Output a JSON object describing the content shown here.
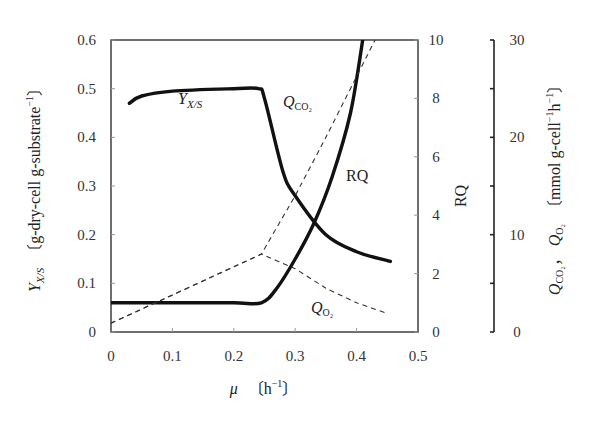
{
  "chart_data": {
    "type": "line",
    "title": "",
    "xlabel": "μ〔h⁻¹〕",
    "x_ticks": [
      "0",
      "0.1",
      "0.2",
      "0.3",
      "0.4",
      "0.5"
    ],
    "xlim": [
      0,
      0.5
    ],
    "axes": {
      "left": {
        "label": "Y_X/S〔g-dry-cell g-substrate⁻¹〕",
        "ticks": [
          "0",
          "0.1",
          "0.2",
          "0.3",
          "0.4",
          "0.5",
          "0.6"
        ],
        "lim": [
          0,
          0.6
        ]
      },
      "right_inner": {
        "label": "RQ",
        "ticks": [
          "0",
          "2",
          "4",
          "6",
          "8",
          "10"
        ],
        "lim": [
          0,
          10
        ]
      },
      "right_outer": {
        "label": "Q_CO2, Q_O2〔mmol g-cell⁻¹h⁻¹〕",
        "ticks": [
          "0",
          "10",
          "20",
          "30"
        ],
        "lim": [
          0,
          30
        ]
      }
    },
    "grid": false,
    "legend": "inline labels",
    "series": [
      {
        "name": "Y_X/S",
        "axis": "left",
        "style": "solid-thick",
        "x": [
          0.03,
          0.05,
          0.1,
          0.2,
          0.24,
          0.25,
          0.28,
          0.3,
          0.35,
          0.4,
          0.455
        ],
        "y": [
          0.47,
          0.485,
          0.495,
          0.5,
          0.5,
          0.48,
          0.33,
          0.28,
          0.2,
          0.165,
          0.145
        ]
      },
      {
        "name": "RQ",
        "axis": "right_inner",
        "style": "solid-thick",
        "x": [
          0,
          0.1,
          0.2,
          0.245,
          0.27,
          0.3,
          0.33,
          0.36,
          0.39,
          0.41
        ],
        "y": [
          1.0,
          1.0,
          1.0,
          1.0,
          1.5,
          2.5,
          3.7,
          5.3,
          7.5,
          10
        ]
      },
      {
        "name": "Q_CO2",
        "axis": "right_outer",
        "style": "dashed",
        "x": [
          0,
          0.245,
          0.3,
          0.35,
          0.43
        ],
        "y": [
          0.9,
          8.0,
          14.0,
          20.0,
          30.0
        ]
      },
      {
        "name": "Q_O2",
        "axis": "right_outer",
        "style": "dashed",
        "x": [
          0,
          0.245,
          0.3,
          0.35,
          0.4,
          0.45
        ],
        "y": [
          0.9,
          8.0,
          6.5,
          4.5,
          3.0,
          1.9
        ]
      }
    ],
    "annotations": [
      {
        "text": "Y_X/S",
        "x": 0.11,
        "y": 0.46
      },
      {
        "text": "Q_CO2",
        "x": 0.29,
        "y": 0.49
      },
      {
        "text": "RQ",
        "x": 0.38,
        "y": 0.29
      },
      {
        "text": "Q_O2",
        "x": 0.35,
        "y": 0.04
      }
    ]
  },
  "labels": {
    "xlabel_mu": "μ",
    "xlabel_unit": "〔h",
    "xlabel_sup": "−1",
    "xlabel_close": "〕",
    "left_main": "Y",
    "left_sub": "X/S",
    "left_unit": "〔g-dry-cell g-substrate",
    "left_sup": "−1",
    "left_close": "〕",
    "rq": "RQ",
    "right_q": "Q",
    "right_co2": "CO₂",
    "right_comma": "，",
    "right_o2": "O₂",
    "right_unit": "〔mmol g-cell",
    "right_sup1": "−1",
    "right_h": "h",
    "right_sup2": "−1",
    "right_close": "〕",
    "ann_yxs_main": "Y",
    "ann_yxs_sub": "X/S",
    "ann_qco2_main": "Q",
    "ann_qco2_sub": "CO₂",
    "ann_rq": "RQ",
    "ann_qo2_main": "Q",
    "ann_qo2_sub": "O₂"
  }
}
